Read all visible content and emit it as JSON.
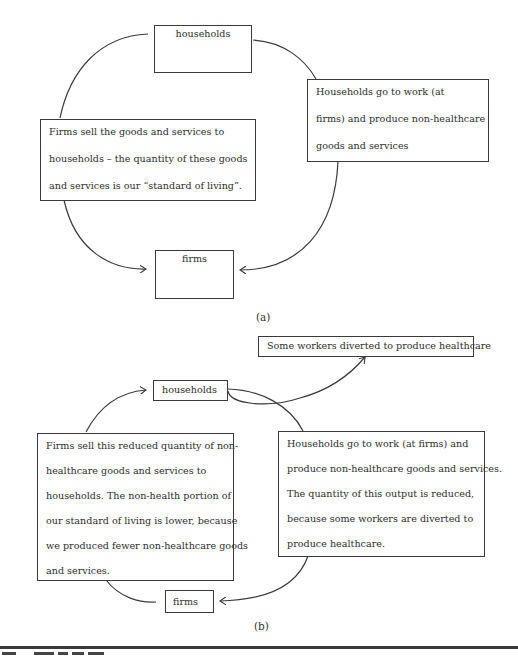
{
  "panel_a": {
    "label": "(a)",
    "households": "households",
    "firms": "firms",
    "left_box": [
      "Firms sell the goods and services to",
      "households – the quantity of these goods",
      "and services is our “standard of living”."
    ],
    "right_box": [
      "Households go to work (at",
      "firms) and produce non-healthcare",
      "goods and services"
    ]
  },
  "panel_b": {
    "label": "(b)",
    "households": "households",
    "firms": "firms",
    "diverted_box": "Some workers diverted to produce healthcare",
    "left_box": [
      "Firms sell this reduced quantity of non-",
      "healthcare goods and services to",
      "households. The non-health portion of",
      "our standard of living is lower, because",
      "we produced fewer non-healthcare goods",
      "and services."
    ],
    "right_box": [
      "Households go to work (at firms) and",
      "produce non-healthcare goods and services.",
      "The quantity of this output is reduced,",
      "because some workers are diverted to",
      "produce healthcare."
    ]
  },
  "colors": {
    "line": "#3a3a3a",
    "text": "#2e2e2e",
    "background": "#ffffff"
  }
}
